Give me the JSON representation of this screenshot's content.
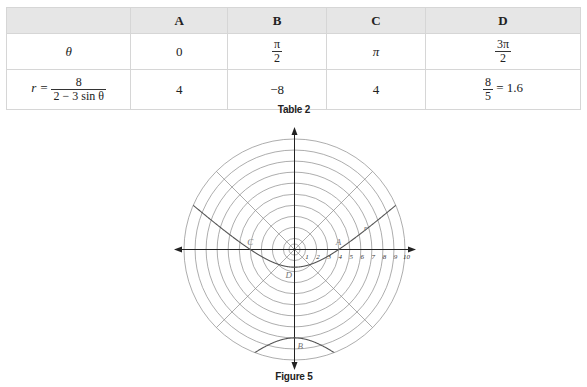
{
  "table": {
    "caption": "Table 2",
    "headers": [
      "",
      "A",
      "B",
      "C",
      "D"
    ],
    "row_theta": {
      "label": "θ",
      "values": [
        {
          "type": "text",
          "text": "0"
        },
        {
          "type": "frac",
          "num": "π",
          "den": "2"
        },
        {
          "type": "text",
          "text": "π"
        },
        {
          "type": "frac",
          "num": "3π",
          "den": "2"
        }
      ]
    },
    "row_r": {
      "label_prefix": "r =",
      "label_num": "8",
      "label_den": "2 − 3 sin θ",
      "values": [
        {
          "type": "text",
          "text": "4"
        },
        {
          "type": "text",
          "text": "−8"
        },
        {
          "type": "text",
          "text": "4"
        },
        {
          "type": "frac",
          "num": "8",
          "den": "5",
          "suffix": "= 1.6"
        }
      ]
    }
  },
  "figure": {
    "caption": "Figure 5",
    "curve_label": "r",
    "point_labels": {
      "A": "A",
      "B": "B",
      "C": "C",
      "D": "D"
    },
    "axis_tick_labels": [
      "1",
      "2",
      "3",
      "4",
      "5",
      "6",
      "7",
      "8",
      "9",
      "10"
    ]
  },
  "chart_data": {
    "type": "polar",
    "title": "Figure 5",
    "equation": "r = 8 / (2 - 3 sin θ)",
    "grid": {
      "circles": [
        0.5,
        1,
        2,
        3,
        4,
        5,
        6,
        7,
        8,
        9,
        10
      ],
      "radial_lines_deg": [
        0,
        45,
        90,
        135,
        180,
        225,
        270,
        315
      ]
    },
    "rmax": 10,
    "points": [
      {
        "label": "A",
        "theta": "0",
        "r": 4
      },
      {
        "label": "B",
        "theta": "π/2",
        "r": -8
      },
      {
        "label": "C",
        "theta": "π",
        "r": 4
      },
      {
        "label": "D",
        "theta": "3π/2",
        "r": 1.6
      }
    ],
    "colors": {
      "grid": "#8a8a8a",
      "axis": "#222222",
      "curve": "#555555",
      "label": "#777777"
    }
  }
}
